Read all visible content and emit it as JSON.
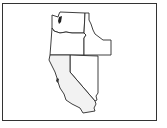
{
  "map": {
    "title": "",
    "region": "Western United States",
    "states": [
      {
        "id": "WA",
        "name": "Washington",
        "fill": "#ffffff"
      },
      {
        "id": "OR",
        "name": "Oregon",
        "fill": "#ffffff"
      },
      {
        "id": "ID",
        "name": "Idaho",
        "fill": "#ffffff"
      },
      {
        "id": "CA",
        "name": "California",
        "fill": "#f2f2f2",
        "highlighted": true
      },
      {
        "id": "NV",
        "name": "Nevada",
        "fill": "#ffffff"
      }
    ],
    "colors": {
      "outline": "#2a2a2a",
      "highlight": "#f2f2f2",
      "background": "#ffffff",
      "water": "#222222"
    }
  }
}
